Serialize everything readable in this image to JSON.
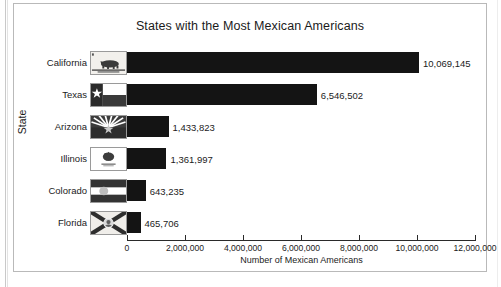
{
  "chart_data": {
    "type": "bar",
    "orientation": "horizontal",
    "title": "States with the Most Mexican Americans",
    "xlabel": "Number of Mexican Americans",
    "ylabel": "State",
    "categories": [
      "California",
      "Texas",
      "Arizona",
      "Illinois",
      "Colorado",
      "Florida"
    ],
    "values": [
      10069145,
      6546502,
      1433823,
      1361997,
      643235,
      465706
    ],
    "value_labels": [
      "10,069,145",
      "6,546,502",
      "1,433,823",
      "1,361,997",
      "643,235",
      "465,706"
    ],
    "xlim": [
      0,
      12000000
    ],
    "xticks": [
      0,
      2000000,
      4000000,
      6000000,
      8000000,
      10000000,
      12000000
    ],
    "xtick_labels": [
      "0",
      "2,000,000",
      "4,000,000",
      "6,000,000",
      "8,000,000",
      "10,000,000",
      "12,000,000"
    ],
    "grid": false,
    "legend": false,
    "bar_color": "#141414",
    "background_color": "#ffffff",
    "category_icons": [
      "flag-california-icon",
      "flag-texas-icon",
      "flag-arizona-icon",
      "flag-illinois-icon",
      "flag-colorado-icon",
      "flag-florida-icon"
    ]
  }
}
